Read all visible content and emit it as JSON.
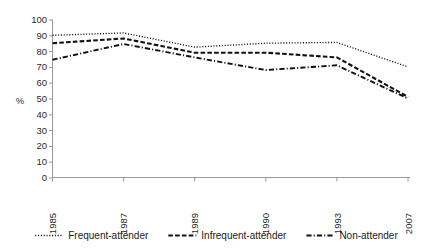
{
  "chart_data": {
    "type": "line",
    "title": "",
    "xlabel": "",
    "ylabel": "%",
    "categories": [
      "1985",
      "1987",
      "1989",
      "1990",
      "1993",
      "2007"
    ],
    "x": [
      1985,
      1987,
      1989,
      1990,
      1993,
      2007
    ],
    "ylim": [
      0,
      100
    ],
    "ytick_step": 10,
    "yticks": [
      "0",
      "10",
      "20",
      "30",
      "40",
      "50",
      "60",
      "70",
      "80",
      "90",
      "100"
    ],
    "grid": false,
    "legend_position": "bottom",
    "xtick_rotation": -90,
    "series": [
      {
        "name": "Frequent-attender",
        "style": "dotted",
        "color": "#111111",
        "values": [
          90,
          91.5,
          82.5,
          85,
          85.5,
          70
        ]
      },
      {
        "name": "Infrequent-attender",
        "style": "dashed",
        "color": "#111111",
        "values": [
          85,
          88,
          79,
          79,
          76,
          51
        ]
      },
      {
        "name": "Non-attender",
        "style": "dash-dot",
        "color": "#111111",
        "values": [
          74.5,
          84.5,
          76,
          68,
          71,
          50
        ]
      }
    ]
  },
  "axis": {
    "y_axis_title": "%"
  },
  "legend": {
    "items": [
      {
        "label": "Frequent-attender",
        "style": "dotted"
      },
      {
        "label": "Infrequent-attender",
        "style": "dashed"
      },
      {
        "label": "Non-attender",
        "style": "dash-dot"
      }
    ]
  }
}
